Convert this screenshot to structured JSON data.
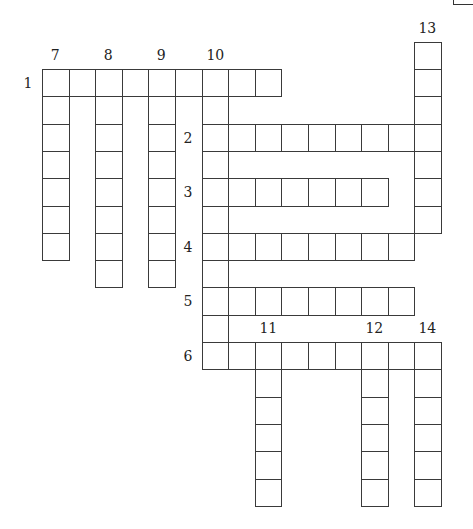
{
  "puzzle": {
    "type": "crossword",
    "grid": {
      "origin_x": 42,
      "origin_y": 69,
      "cell_w": 26.6,
      "cell_h": 27.3,
      "line_color": "#3a3a3a"
    },
    "across": [
      {
        "number": "1",
        "row": 0,
        "col": 0,
        "length": 9
      },
      {
        "number": "2",
        "row": 2,
        "col": 6,
        "length": 9
      },
      {
        "number": "3",
        "row": 4,
        "col": 6,
        "length": 7
      },
      {
        "number": "4",
        "row": 6,
        "col": 6,
        "length": 8
      },
      {
        "number": "5",
        "row": 8,
        "col": 6,
        "length": 8
      },
      {
        "number": "6",
        "row": 10,
        "col": 6,
        "length": 9
      }
    ],
    "down": [
      {
        "number": "7",
        "row": 0,
        "col": 0,
        "length": 7
      },
      {
        "number": "8",
        "row": 0,
        "col": 2,
        "length": 8
      },
      {
        "number": "9",
        "row": 0,
        "col": 4,
        "length": 8
      },
      {
        "number": "10",
        "row": 0,
        "col": 6,
        "length": 11
      },
      {
        "number": "11",
        "row": 10,
        "col": 8,
        "length": 6
      },
      {
        "number": "12",
        "row": 10,
        "col": 12,
        "length": 6
      },
      {
        "number": "13",
        "row": -1,
        "col": 14,
        "length": 7
      },
      {
        "number": "14",
        "row": 10,
        "col": 14,
        "length": 6
      }
    ]
  }
}
